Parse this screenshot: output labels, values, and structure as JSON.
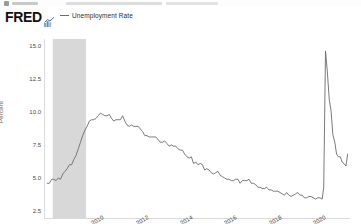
{
  "top_strip": {
    "present": true
  },
  "header": {
    "logo_text": "FRED",
    "logo_mark_name": "fred-chart-mark",
    "legend": {
      "marker": "line",
      "label": "Unemployment Rate",
      "color": "#6b6b6b"
    }
  },
  "chart_data": {
    "type": "line",
    "title": "",
    "subtitle": "",
    "xlabel": "",
    "ylabel": "Percent",
    "series_name": "Unemployment Rate",
    "line_color": "#6b6b6b",
    "grid": false,
    "legend_position": "top-left",
    "xlim": [
      2007.6,
      2021.4
    ],
    "ylim": [
      2.0,
      15.6
    ],
    "yticks": [
      "15.0",
      "12.5",
      "10.0",
      "7.5",
      "5.0",
      "2.5"
    ],
    "ytick_values": [
      15.0,
      12.5,
      10.0,
      7.5,
      5.0,
      2.5
    ],
    "xticks": [
      "2010",
      "2012",
      "2014",
      "2016",
      "2018",
      "2020"
    ],
    "xtick_values": [
      2010,
      2012,
      2014,
      2016,
      2018,
      2020
    ],
    "recession_bands": [
      {
        "start": 2007.95,
        "end": 2009.45,
        "color": "#d8d8d8"
      }
    ],
    "x": [
      2007.7,
      2007.8,
      2007.9,
      2008.0,
      2008.1,
      2008.2,
      2008.3,
      2008.4,
      2008.5,
      2008.6,
      2008.7,
      2008.8,
      2008.9,
      2009.0,
      2009.1,
      2009.2,
      2009.3,
      2009.4,
      2009.5,
      2009.6,
      2009.7,
      2009.8,
      2009.9,
      2010.0,
      2010.1,
      2010.2,
      2010.3,
      2010.4,
      2010.5,
      2010.6,
      2010.7,
      2010.8,
      2010.9,
      2011.0,
      2011.1,
      2011.2,
      2011.3,
      2011.4,
      2011.5,
      2011.6,
      2011.7,
      2011.8,
      2011.9,
      2012.0,
      2012.1,
      2012.2,
      2012.3,
      2012.4,
      2012.5,
      2012.6,
      2012.7,
      2012.8,
      2012.9,
      2013.0,
      2013.1,
      2013.2,
      2013.3,
      2013.4,
      2013.5,
      2013.6,
      2013.7,
      2013.8,
      2013.9,
      2014.0,
      2014.1,
      2014.2,
      2014.3,
      2014.4,
      2014.5,
      2014.6,
      2014.7,
      2014.8,
      2014.9,
      2015.0,
      2015.1,
      2015.2,
      2015.3,
      2015.4,
      2015.5,
      2015.6,
      2015.7,
      2015.8,
      2015.9,
      2016.0,
      2016.1,
      2016.2,
      2016.3,
      2016.4,
      2016.5,
      2016.6,
      2016.7,
      2016.8,
      2016.9,
      2017.0,
      2017.1,
      2017.2,
      2017.3,
      2017.4,
      2017.5,
      2017.6,
      2017.7,
      2017.8,
      2017.9,
      2018.0,
      2018.1,
      2018.2,
      2018.3,
      2018.4,
      2018.5,
      2018.6,
      2018.7,
      2018.8,
      2018.9,
      2019.0,
      2019.1,
      2019.2,
      2019.3,
      2019.4,
      2019.5,
      2019.6,
      2019.7,
      2019.8,
      2019.9,
      2020.0,
      2020.1,
      2020.17,
      2020.25,
      2020.33,
      2020.42,
      2020.5,
      2020.58,
      2020.67,
      2020.75,
      2020.83,
      2020.92,
      2021.0,
      2021.08,
      2021.17,
      2021.25
    ],
    "values": [
      4.7,
      4.7,
      5.0,
      5.0,
      4.9,
      5.1,
      5.0,
      5.4,
      5.6,
      5.8,
      6.1,
      6.1,
      6.5,
      6.8,
      7.3,
      7.8,
      8.3,
      8.7,
      9.0,
      9.4,
      9.5,
      9.5,
      9.6,
      9.8,
      10.0,
      9.9,
      9.8,
      9.8,
      9.9,
      9.6,
      9.4,
      9.5,
      9.5,
      9.5,
      9.8,
      9.4,
      9.1,
      9.0,
      9.1,
      9.0,
      9.0,
      9.0,
      8.8,
      8.6,
      8.3,
      8.3,
      8.2,
      8.2,
      8.2,
      8.2,
      8.0,
      7.8,
      7.8,
      7.9,
      7.7,
      7.5,
      7.6,
      7.5,
      7.5,
      7.3,
      7.2,
      7.2,
      6.9,
      6.7,
      6.6,
      6.7,
      6.2,
      6.3,
      6.1,
      6.2,
      6.1,
      5.7,
      5.8,
      5.7,
      5.5,
      5.4,
      5.5,
      5.6,
      5.3,
      5.2,
      5.1,
      5.0,
      5.0,
      4.9,
      4.9,
      5.0,
      5.0,
      4.7,
      4.9,
      4.9,
      4.9,
      5.0,
      4.7,
      4.7,
      4.6,
      4.4,
      4.4,
      4.3,
      4.3,
      4.4,
      4.2,
      4.2,
      4.1,
      4.1,
      4.1,
      4.0,
      3.9,
      3.8,
      4.0,
      3.8,
      3.7,
      3.8,
      3.9,
      4.0,
      3.8,
      3.8,
      3.6,
      3.6,
      3.7,
      3.7,
      3.6,
      3.5,
      3.6,
      3.6,
      3.5,
      4.4,
      14.7,
      13.2,
      11.0,
      10.2,
      8.4,
      7.8,
      6.9,
      6.7,
      6.7,
      6.3,
      6.2,
      6.0,
      6.9
    ]
  }
}
